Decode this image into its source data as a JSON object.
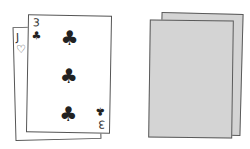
{
  "hand": {
    "cards": [
      {
        "rank": "J",
        "suit": "♡",
        "suit_name": "hearts",
        "face_up": true
      },
      {
        "rank": "3",
        "suit": "♣",
        "suit_name": "clubs",
        "face_up": true,
        "bottom_rank": "3",
        "bottom_suit": "♣"
      }
    ]
  },
  "deck": {
    "cards": [
      {
        "face_up": false,
        "color": "#d4d4d4"
      },
      {
        "face_up": false,
        "color": "#d4d4d4"
      }
    ]
  }
}
